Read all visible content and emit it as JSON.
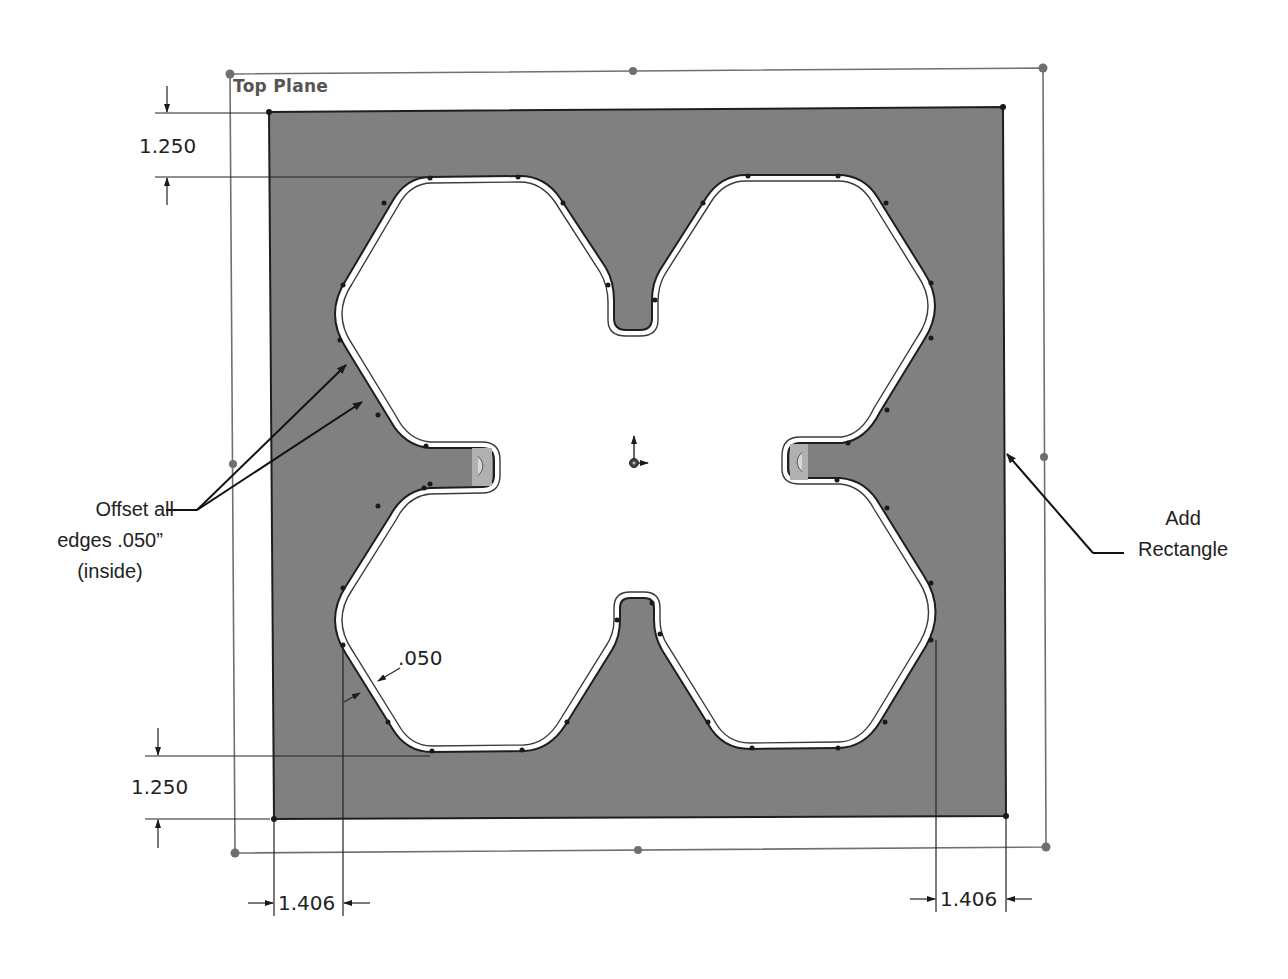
{
  "sketch": {
    "plane_label": "Top Plane",
    "fill_color": "#7f7f7f",
    "line_color": "#1e1e1e",
    "construction_color": "#6b6b6b"
  },
  "dimensions": {
    "top_vertical": "1.250",
    "bottom_vertical": "1.250",
    "bottom_left_horizontal": "1.406",
    "bottom_right_horizontal": "1.406",
    "offset": ".050"
  },
  "callouts": {
    "offset": {
      "line1": "Offset all",
      "line2": "edges .050”",
      "line3": "(inside)"
    },
    "rectangle": {
      "line1": "Add",
      "line2": "Rectangle"
    }
  }
}
